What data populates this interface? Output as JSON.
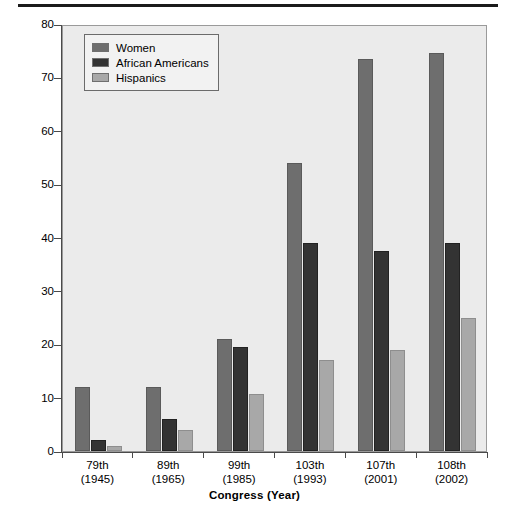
{
  "chart_data": {
    "type": "bar",
    "title": "",
    "xlabel": "Congress (Year)",
    "ylabel": "Number",
    "ylim": [
      0,
      80
    ],
    "yticks": [
      0,
      10,
      20,
      30,
      40,
      50,
      60,
      70,
      80
    ],
    "grid": false,
    "legend_position": "top-left",
    "categories": [
      "79th\n(1945)",
      "89th\n(1965)",
      "99th\n(1985)",
      "103th\n(1993)",
      "107th\n(2001)",
      "108th\n(2002)"
    ],
    "category_lines": [
      {
        "congress": "79th",
        "year": "(1945)"
      },
      {
        "congress": "89th",
        "year": "(1965)"
      },
      {
        "congress": "99th",
        "year": "(1985)"
      },
      {
        "congress": "103th",
        "year": "(1993)"
      },
      {
        "congress": "107th",
        "year": "(2001)"
      },
      {
        "congress": "108th",
        "year": "(2002)"
      }
    ],
    "series": [
      {
        "name": "Women",
        "color": "#6e6e6e",
        "values": [
          12,
          12,
          21,
          54,
          73.5,
          74.5
        ]
      },
      {
        "name": "African Americans",
        "color": "#333333",
        "values": [
          2,
          6,
          19.5,
          39,
          37.5,
          39
        ]
      },
      {
        "name": "Hispanics",
        "color": "#a8a8a8",
        "values": [
          1,
          4,
          10.7,
          17,
          19,
          25
        ]
      }
    ]
  },
  "legend": {
    "items": [
      {
        "label": "Women",
        "swatch": "women"
      },
      {
        "label": "African Americans",
        "swatch": "african"
      },
      {
        "label": "Hispanics",
        "swatch": "hisp"
      }
    ]
  },
  "axes": {
    "y_title": "Number",
    "x_title": "Congress (Year)",
    "y_tick_labels": [
      "0",
      "10",
      "20",
      "30",
      "40",
      "50",
      "60",
      "70",
      "80"
    ]
  }
}
